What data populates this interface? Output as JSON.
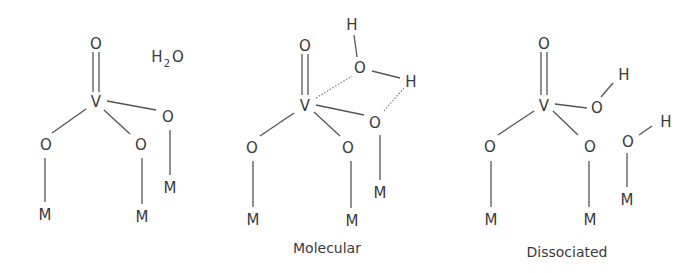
{
  "colors": {
    "ink": "#3a3a3a",
    "bond": "#555555",
    "background": "#ffffff"
  },
  "structures": [
    {
      "id": "initial",
      "label": "",
      "atoms": {
        "o_top": "O",
        "v": "V",
        "o_right": "O",
        "o_left": "O",
        "o_mid": "O",
        "m_left": "M",
        "m_mid": "M",
        "m_right": "M"
      },
      "water": {
        "h": "H",
        "sub": "2",
        "o": "O"
      }
    },
    {
      "id": "molecular",
      "label": "Molecular",
      "atoms": {
        "o_top": "O",
        "v": "V",
        "h_top": "H",
        "o_water": "O",
        "h_bridge": "H",
        "o_right": "O",
        "o_left": "O",
        "o_mid": "O",
        "m_left": "M",
        "m_mid": "M",
        "m_right": "M"
      }
    },
    {
      "id": "dissociated",
      "label": "Dissociated",
      "atoms": {
        "o_top": "O",
        "v": "V",
        "o_hydroxyl": "O",
        "h_hydroxyl": "H",
        "o_left": "O",
        "o_mid": "O",
        "o_surface": "O",
        "h_surface": "H",
        "m_left": "M",
        "m_mid": "M",
        "m_right": "M"
      }
    }
  ]
}
